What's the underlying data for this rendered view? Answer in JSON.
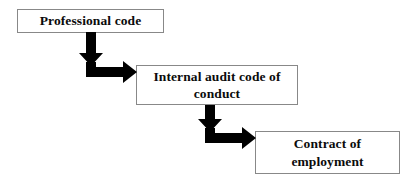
{
  "diagram": {
    "type": "flowchart",
    "orientation": "top-left to bottom-right cascade",
    "background_color": "#ffffff",
    "box_border_color": "#888888",
    "box_fill_color": "#ffffff",
    "arrow_color": "#000000",
    "text_color": "#0b0b0b",
    "nodes": [
      {
        "id": "professional-code",
        "label": "Professional code",
        "order": 1
      },
      {
        "id": "internal-audit-code",
        "label": "Internal audit code of conduct",
        "line1": "Internal audit code of",
        "line2": "conduct",
        "order": 2
      },
      {
        "id": "contract-employment",
        "label": "Contract of employment",
        "line1": "Contract of",
        "line2": "employment",
        "order": 3
      }
    ],
    "connectors": [
      {
        "id": "arrow-professional-to-internal",
        "from": "professional-code",
        "to": "internal-audit-code",
        "shape": "elbow-down-right",
        "icon": "elbow-arrow-icon"
      },
      {
        "id": "arrow-internal-to-contract",
        "from": "internal-audit-code",
        "to": "contract-employment",
        "shape": "elbow-down-right",
        "icon": "elbow-arrow-icon"
      }
    ]
  }
}
